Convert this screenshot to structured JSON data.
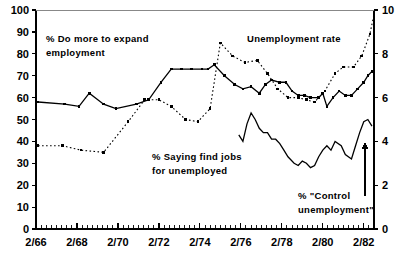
{
  "chart_data": {
    "type": "line",
    "title": "",
    "xlabel": "",
    "ylabel": "",
    "grid": false,
    "legend_position": "inline-annotations",
    "x_ticks": [
      "2/66",
      "2/68",
      "2/70",
      "2/72",
      "2/74",
      "2/76",
      "2/78",
      "2/80",
      "2/82"
    ],
    "x_tick_years": [
      66,
      68,
      70,
      72,
      74,
      76,
      78,
      80,
      82
    ],
    "x_minor_tick_interval_years": 0.25,
    "xlim": [
      66.0,
      82.5
    ],
    "left_axis": {
      "label": "",
      "ylim": [
        0,
        100
      ],
      "ticks": [
        "0",
        "10",
        "20",
        "30",
        "40",
        "50",
        "60",
        "70",
        "80",
        "90",
        "100"
      ],
      "tick_values": [
        0,
        10,
        20,
        30,
        40,
        50,
        60,
        70,
        80,
        90,
        100
      ]
    },
    "right_axis": {
      "label": "",
      "ylim": [
        0,
        10
      ],
      "ticks": [
        "0",
        "2",
        "4",
        "6",
        "8",
        "10"
      ],
      "tick_values": [
        0,
        2,
        4,
        6,
        8,
        10
      ]
    },
    "series": [
      {
        "name": "% Do more to expand employment",
        "style": "solid",
        "marker": "square",
        "axis": "left",
        "color": "#000000",
        "points": [
          [
            66.1,
            58
          ],
          [
            67.4,
            57
          ],
          [
            68.1,
            56
          ],
          [
            68.6,
            62
          ],
          [
            69.3,
            57
          ],
          [
            69.9,
            55
          ],
          [
            70.9,
            57
          ],
          [
            71.5,
            59
          ],
          [
            72.1,
            67
          ],
          [
            72.6,
            73
          ],
          [
            73.1,
            73
          ],
          [
            73.6,
            73
          ],
          [
            74.1,
            73
          ],
          [
            74.4,
            73
          ],
          [
            74.7,
            75
          ],
          [
            75.2,
            70
          ],
          [
            75.7,
            66
          ],
          [
            76.1,
            64
          ],
          [
            76.5,
            65
          ],
          [
            76.9,
            62
          ],
          [
            77.2,
            66
          ],
          [
            77.5,
            68
          ],
          [
            77.9,
            67
          ],
          [
            78.2,
            67
          ],
          [
            78.5,
            63
          ],
          [
            78.8,
            61
          ],
          [
            79.1,
            61
          ],
          [
            79.4,
            60
          ],
          [
            79.8,
            60
          ],
          [
            80.0,
            62
          ],
          [
            80.2,
            56
          ],
          [
            80.5,
            60
          ],
          [
            80.8,
            63
          ],
          [
            81.1,
            61
          ],
          [
            81.4,
            61
          ],
          [
            81.7,
            64
          ],
          [
            82.0,
            67
          ],
          [
            82.2,
            70
          ],
          [
            82.4,
            72
          ]
        ]
      },
      {
        "name": "Unemployment rate",
        "style": "dotted",
        "marker": "square",
        "axis": "right",
        "color": "#000000",
        "points": [
          [
            66.1,
            3.8
          ],
          [
            67.3,
            3.8
          ],
          [
            68.2,
            3.6
          ],
          [
            69.3,
            3.5
          ],
          [
            70.5,
            4.9
          ],
          [
            71.3,
            5.9
          ],
          [
            72.0,
            5.9
          ],
          [
            72.6,
            5.6
          ],
          [
            73.3,
            5.0
          ],
          [
            73.9,
            4.9
          ],
          [
            74.5,
            5.5
          ],
          [
            75.0,
            8.5
          ],
          [
            75.6,
            7.9
          ],
          [
            76.2,
            7.6
          ],
          [
            76.8,
            7.7
          ],
          [
            77.3,
            7.1
          ],
          [
            77.8,
            6.4
          ],
          [
            78.3,
            6.0
          ],
          [
            78.8,
            6.0
          ],
          [
            79.2,
            5.9
          ],
          [
            79.6,
            5.8
          ],
          [
            80.1,
            6.3
          ],
          [
            80.6,
            7.1
          ],
          [
            81.0,
            7.4
          ],
          [
            81.5,
            7.4
          ],
          [
            81.9,
            7.9
          ],
          [
            82.3,
            8.9
          ],
          [
            82.5,
            9.8
          ]
        ]
      },
      {
        "name": "% Saying find jobs for unemployed / % \"Control unemployment\"",
        "style": "solid",
        "marker": "none",
        "axis": "left",
        "color": "#000000",
        "points": [
          [
            75.9,
            43
          ],
          [
            76.1,
            40
          ],
          [
            76.3,
            48
          ],
          [
            76.5,
            53
          ],
          [
            76.7,
            50
          ],
          [
            76.9,
            46
          ],
          [
            77.1,
            44
          ],
          [
            77.3,
            44
          ],
          [
            77.5,
            41
          ],
          [
            77.7,
            41
          ],
          [
            77.9,
            39
          ],
          [
            78.1,
            36
          ],
          [
            78.3,
            33
          ],
          [
            78.6,
            30
          ],
          [
            78.8,
            29
          ],
          [
            79.0,
            31
          ],
          [
            79.2,
            30
          ],
          [
            79.4,
            28
          ],
          [
            79.6,
            29
          ],
          [
            79.8,
            33
          ],
          [
            80.0,
            36
          ],
          [
            80.2,
            38
          ],
          [
            80.4,
            36
          ],
          [
            80.6,
            40
          ],
          [
            80.9,
            38
          ],
          [
            81.1,
            34
          ],
          [
            81.4,
            32
          ],
          [
            81.6,
            38
          ],
          [
            81.8,
            44
          ],
          [
            82.0,
            49
          ],
          [
            82.2,
            50
          ],
          [
            82.4,
            47
          ]
        ]
      }
    ],
    "annotations": [
      {
        "id": "expand-employment",
        "lines": [
          "% Do more to expand",
          "employment"
        ],
        "x": 46,
        "y": 42
      },
      {
        "id": "unemployment-rate",
        "lines": [
          "Unemployment rate"
        ],
        "x": 247,
        "y": 42
      },
      {
        "id": "find-jobs",
        "lines": [
          "% Saying find jobs",
          "for unemployed"
        ],
        "x": 152,
        "y": 160
      },
      {
        "id": "control-unemployment",
        "lines": [
          "% \"Control",
          "unemployment\""
        ],
        "x": 298,
        "y": 199
      }
    ],
    "arrow": {
      "id": "control-unemployment-arrow",
      "x": 365,
      "y_top": 143,
      "y_bottom": 196
    }
  }
}
